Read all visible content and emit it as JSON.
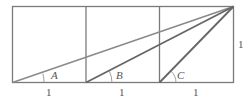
{
  "diagram": {
    "type": "geometry",
    "squares": 3,
    "angles": [
      {
        "label": "A"
      },
      {
        "label": "B"
      },
      {
        "label": "C"
      }
    ],
    "bottom_labels": [
      "1",
      "1",
      "1"
    ],
    "side_label": "1",
    "colors": {
      "frame": "#7a7a7a",
      "line_a": "#8a8a8a",
      "line_b": "#6a6a6a",
      "line_c": "#6a6a6a",
      "text": "#555555"
    }
  }
}
